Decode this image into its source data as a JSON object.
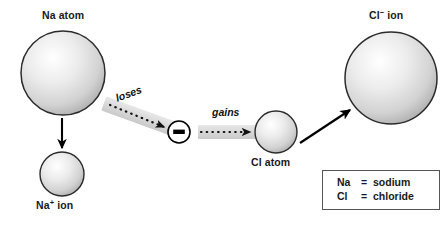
{
  "diagram": {
    "type": "process-diagram",
    "background_color": "#ffffff",
    "sphere_fill_light": "#fcfcfc",
    "sphere_fill_dark": "#b4b4b4",
    "sphere_stroke": "#2b2b2b",
    "arrow_color": "#000000",
    "band_color": "#d9d9d9"
  },
  "nodes": {
    "na_atom": {
      "label": "Na atom",
      "kind": "atom",
      "element": "Na",
      "charge": "",
      "radius_px": 42,
      "center": [
        63,
        73
      ]
    },
    "na_ion": {
      "label_prefix": "Na",
      "label_charge": "+",
      "label_suffix": " ion",
      "label_plain": "Na+ ion",
      "kind": "ion",
      "element": "Na",
      "charge": "+",
      "radius_px": 22,
      "center": [
        62,
        174
      ]
    },
    "electron": {
      "label": "electron",
      "symbol": "−",
      "kind": "electron",
      "charge": "-",
      "radius_px": 11,
      "center": [
        179,
        132
      ]
    },
    "cl_atom": {
      "label": "Cl atom",
      "kind": "atom",
      "element": "Cl",
      "charge": "",
      "radius_px": 21,
      "center": [
        276,
        132
      ]
    },
    "cl_ion": {
      "label_prefix": "Cl",
      "label_charge": "−",
      "label_suffix": " ion",
      "label_plain": "Cl- ion",
      "kind": "ion",
      "element": "Cl",
      "charge": "-",
      "radius_px": 46,
      "center": [
        391,
        78
      ]
    }
  },
  "arrows": [
    {
      "name": "na-to-na-ion",
      "style": "solid",
      "from": "na_atom",
      "to": "na_ion",
      "direction": "down"
    },
    {
      "name": "loses-electron",
      "style": "dotted-on-band",
      "label": "loses",
      "from": "na_atom",
      "to": "electron",
      "direction": "down-right"
    },
    {
      "name": "gains-electron",
      "style": "dotted-on-band",
      "label": "gains",
      "from": "electron",
      "to": "cl_atom",
      "direction": "right"
    },
    {
      "name": "cl-to-cl-ion",
      "style": "solid",
      "from": "cl_atom",
      "to": "cl_ion",
      "direction": "up-right"
    }
  ],
  "legend": {
    "rows": [
      {
        "symbol": "Na",
        "equals": "=",
        "name": "sodium"
      },
      {
        "symbol": "Cl",
        "equals": "=",
        "name": "chloride"
      }
    ]
  }
}
